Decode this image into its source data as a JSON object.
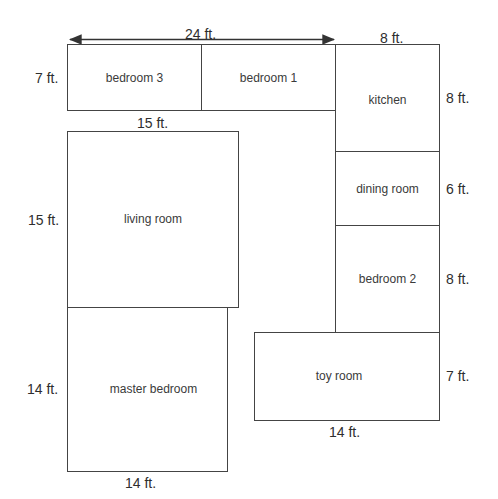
{
  "diagram": {
    "type": "floor-plan",
    "overall_dimension": {
      "label": "24 ft.",
      "direction": "horizontal-double-arrow"
    },
    "rooms": [
      {
        "id": "bedroom-3",
        "label": "bedroom 3"
      },
      {
        "id": "bedroom-1",
        "label": "bedroom 1"
      },
      {
        "id": "kitchen",
        "label": "kitchen"
      },
      {
        "id": "dining-room",
        "label": "dining room"
      },
      {
        "id": "bedroom-2",
        "label": "bedroom 2"
      },
      {
        "id": "living-room",
        "label": "living room"
      },
      {
        "id": "master-bedroom",
        "label": "master bedroom"
      },
      {
        "id": "toy-room",
        "label": "toy room"
      }
    ],
    "dimensions": {
      "top_row_height": "7 ft.",
      "kitchen_width": "8 ft.",
      "kitchen_height": "8 ft.",
      "dining_room_height": "6 ft.",
      "bedroom_2_height": "8 ft.",
      "toy_room_height": "7 ft.",
      "toy_room_width": "14 ft.",
      "living_room_width": "15 ft.",
      "living_room_height": "15 ft.",
      "master_bedroom_height": "14 ft.",
      "master_bedroom_width": "14 ft."
    },
    "colors": {
      "line": "#444444",
      "text": "#333333",
      "background": "#ffffff"
    }
  }
}
